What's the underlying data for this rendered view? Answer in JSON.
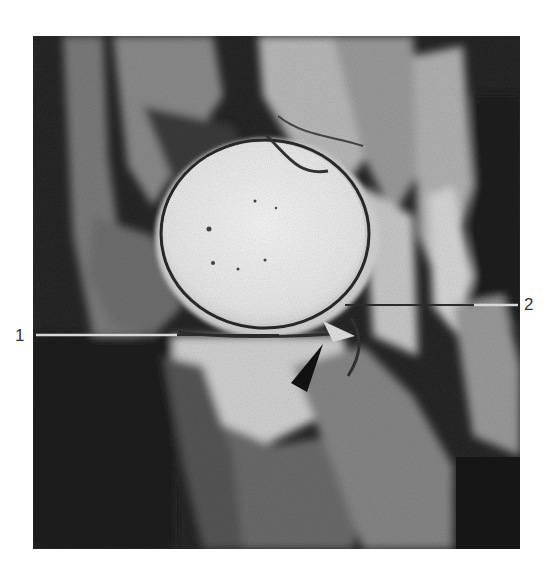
{
  "figure": {
    "type": "sagittal knee MRI (grayscale)",
    "labels": [
      {
        "id": "1",
        "text": "1",
        "side": "left"
      },
      {
        "id": "2",
        "text": "2",
        "side": "right"
      }
    ],
    "markers": [
      {
        "type": "arrowhead",
        "color": "#111111",
        "direction": "up-right"
      }
    ],
    "colors": {
      "background": "#ffffff",
      "bone_bright": "#ececec",
      "soft_tissue_mid": "#8a8a8a",
      "dark_tissue": "#262626",
      "leader_line_light": "#d8d8d8",
      "leader_line_dark": "#2b2b2b"
    }
  }
}
